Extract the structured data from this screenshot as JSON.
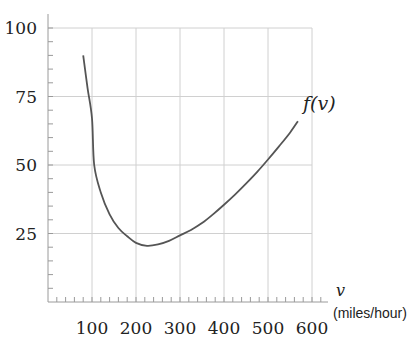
{
  "chart_data": {
    "type": "line",
    "title": "",
    "xlabel": "v",
    "xlabel_units": "(miles/hour)",
    "ylabel": "",
    "xlim": [
      0,
      600
    ],
    "ylim": [
      0,
      100
    ],
    "x_ticks": [
      100,
      200,
      300,
      400,
      500,
      600
    ],
    "y_ticks": [
      25,
      50,
      75,
      100
    ],
    "x_minor_step": 20,
    "y_minor_step": 5,
    "grid": true,
    "series": [
      {
        "name": "f(v)",
        "label": "f(v)",
        "x": [
          80,
          90,
          100,
          105,
          120,
          140,
          160,
          180,
          200,
          225,
          250,
          275,
          300,
          325,
          350,
          375,
          400,
          425,
          450,
          475,
          500,
          525,
          550,
          568
        ],
        "y": [
          90,
          78,
          67,
          50,
          40,
          32,
          27,
          24,
          21.6,
          20.5,
          21,
          22.3,
          24.3,
          26.3,
          28.8,
          32,
          35.5,
          39.2,
          43.2,
          47.4,
          52,
          56.8,
          61.8,
          66
        ]
      }
    ]
  },
  "labels": {
    "y_ticks": [
      "100",
      "75",
      "50",
      "25"
    ],
    "x_ticks": [
      "100",
      "200",
      "300",
      "400",
      "500",
      "600"
    ],
    "series_label": "f(v)",
    "x_var": "v",
    "x_units": "(miles/hour)"
  },
  "colors": {
    "curve": "#555555",
    "grid": "#d0d0d0",
    "axis": "#9a9a9a",
    "text": "#222222"
  }
}
